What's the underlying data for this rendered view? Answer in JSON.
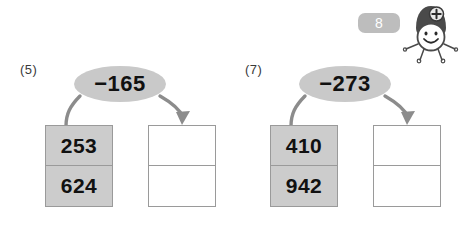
{
  "page": {
    "number_badge": "8",
    "mascot_icon": "smiling-character-with-plus-badge-icon",
    "badge_color": "#bdbdbd",
    "box_fill_gray": "#cccccc",
    "box_fill_white": "#ffffff",
    "border_color": "#9a9a9a",
    "ellipse_color": "#c9c9c9",
    "arrow_color": "#8c8c8c"
  },
  "problems": [
    {
      "label": "(5)",
      "operator": "−165",
      "source": {
        "top": "253",
        "bottom": "624"
      },
      "answer": {
        "top": "",
        "bottom": ""
      }
    },
    {
      "label": "(7)",
      "operator": "−273",
      "source": {
        "top": "410",
        "bottom": "942"
      },
      "answer": {
        "top": "",
        "bottom": ""
      }
    }
  ]
}
